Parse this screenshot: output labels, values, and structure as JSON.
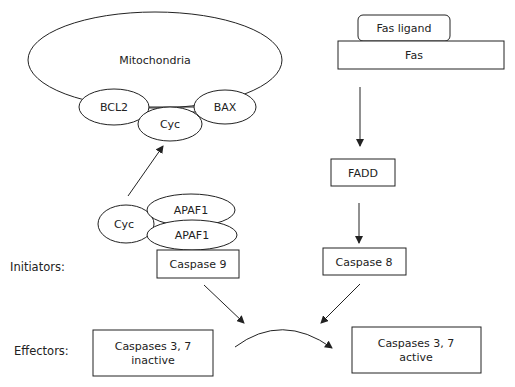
{
  "diagram": {
    "side_labels": {
      "initiators": "Initiators:",
      "effectors": "Effectors:"
    },
    "intrinsic_pathway": {
      "mitochondria": "Mitochondria",
      "bcl2": "BCL2",
      "bax": "BAX",
      "cyc_released": "Cyc",
      "cyc_bound": "Cyc",
      "apaf1_top": "APAF1",
      "apaf1_bottom": "APAF1",
      "caspase9": "Caspase 9"
    },
    "extrinsic_pathway": {
      "fas_ligand": "Fas ligand",
      "fas": "Fas",
      "fadd": "FADD",
      "caspase8": "Caspase 8"
    },
    "effectors": {
      "inactive_line1": "Caspases 3, 7",
      "inactive_line2": "inactive",
      "active_line1": "Caspases 3, 7",
      "active_line2": "active"
    },
    "edges": [
      {
        "from": "Cyc (APAF1 complex)",
        "to": "Cyc (mitochondria)"
      },
      {
        "from": "Fas",
        "to": "FADD"
      },
      {
        "from": "FADD",
        "to": "Caspase 8"
      },
      {
        "from": "Caspase 9",
        "to": "activation"
      },
      {
        "from": "Caspase 8",
        "to": "activation"
      },
      {
        "from": "Caspases 3, 7 inactive",
        "to": "Caspases 3, 7 active"
      }
    ],
    "colors": {
      "stroke": "#222222",
      "background": "#ffffff"
    }
  }
}
